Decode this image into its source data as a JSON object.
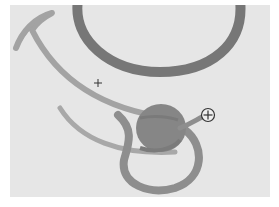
{
  "canvas": {
    "background": "#e6e6e6",
    "page_background": "#ffffff"
  },
  "shapes": {
    "ellipse_ring": {
      "color": "#777777",
      "label": "ellipse-ring"
    },
    "upper_stroke": {
      "color": "#a3a3a3",
      "label": "curved-brush-stroke"
    },
    "lower_stroke": {
      "color": "#a8a8a8",
      "label": "curved-brush-stroke"
    },
    "filled_circle": {
      "color": "#868686",
      "label": "filled-circle"
    },
    "loop": {
      "color": "#8e8e8e",
      "label": "loop-stroke"
    }
  },
  "cursors": {
    "crosshair": {
      "glyph": "+",
      "x": 98,
      "y": 83
    },
    "add_cursor": {
      "glyph": "⊕",
      "x": 208,
      "y": 115
    }
  }
}
